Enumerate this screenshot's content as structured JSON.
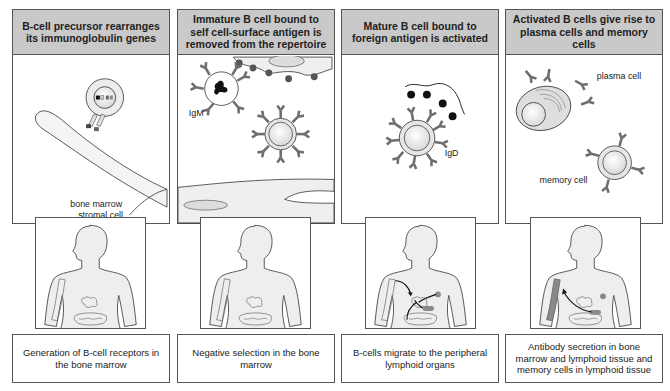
{
  "panels": [
    {
      "header": "B-cell precursor rearranges its immunoglobulin genes",
      "labels": {
        "stromal": "bone marrow",
        "stromal2": "stromal cell"
      },
      "caption": "Generation of B-cell receptors in the bone marrow"
    },
    {
      "header": "Immature B cell bound to self cell-surface antigen is removed from the repertoire",
      "labels": {
        "igm": "IgM"
      },
      "caption": "Negative selection in the bone marrow"
    },
    {
      "header": "Mature B cell bound to foreign antigen is activated",
      "labels": {
        "igd": "IgD"
      },
      "caption": "B-cells migrate to the peripheral lymphoid organs"
    },
    {
      "header": "Activated B cells give rise to plasma cells and memory cells",
      "labels": {
        "plasma": "plasma cell",
        "memory": "memory cell"
      },
      "caption": "Antibody secretion in bone marrow and lymphoid tissue and memory cells in lymphoid tissue"
    }
  ],
  "colors": {
    "header_bg": "#c9c9c9",
    "border": "#555555",
    "antibody": "#6e6e6e",
    "antigen": "#333333",
    "cell_fill": "#e6e6e6",
    "body_fill": "#eeeeee",
    "organ_highlight": "#8a8a8a"
  }
}
